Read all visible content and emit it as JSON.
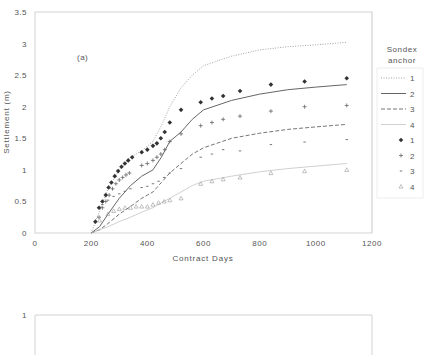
{
  "chart_data": [
    {
      "type": "line",
      "panel_label": "(a)",
      "title": "",
      "xlabel": "Contract Days",
      "ylabel": "Settlement (m)",
      "xlim": [
        0,
        1200
      ],
      "ylim": [
        0,
        3.5
      ],
      "xticks": [
        0,
        200,
        400,
        600,
        800,
        1000,
        1200
      ],
      "yticks": [
        0,
        0.5,
        1,
        1.5,
        2,
        2.5,
        3,
        3.5
      ],
      "grid": false,
      "legend_position": "right",
      "legend_title": "Sondex anchor",
      "series": [
        {
          "name": "1",
          "kind": "line",
          "style": "dotted",
          "x": [
            200,
            230,
            260,
            300,
            340,
            380,
            420,
            450,
            480,
            520,
            560,
            600,
            700,
            800,
            900,
            1000,
            1110
          ],
          "y": [
            0.0,
            0.35,
            0.7,
            1.0,
            1.2,
            1.3,
            1.45,
            1.7,
            2.0,
            2.3,
            2.5,
            2.65,
            2.8,
            2.9,
            2.95,
            2.98,
            3.02
          ]
        },
        {
          "name": "2",
          "kind": "line",
          "style": "solid",
          "x": [
            200,
            230,
            260,
            300,
            340,
            380,
            420,
            450,
            480,
            520,
            560,
            600,
            700,
            800,
            900,
            1000,
            1110
          ],
          "y": [
            0.0,
            0.1,
            0.3,
            0.55,
            0.75,
            0.9,
            1.0,
            1.2,
            1.45,
            1.6,
            1.8,
            1.95,
            2.1,
            2.2,
            2.27,
            2.31,
            2.35
          ]
        },
        {
          "name": "3",
          "kind": "line",
          "style": "dashed",
          "x": [
            200,
            230,
            260,
            300,
            340,
            380,
            420,
            450,
            480,
            520,
            560,
            600,
            700,
            800,
            900,
            1000,
            1110
          ],
          "y": [
            0.0,
            0.05,
            0.15,
            0.3,
            0.42,
            0.55,
            0.65,
            0.8,
            0.95,
            1.1,
            1.25,
            1.35,
            1.5,
            1.58,
            1.64,
            1.68,
            1.72
          ]
        },
        {
          "name": "4",
          "kind": "line",
          "style": "thin",
          "x": [
            200,
            230,
            260,
            300,
            340,
            380,
            420,
            450,
            480,
            520,
            560,
            600,
            700,
            800,
            900,
            1000,
            1110
          ],
          "y": [
            0.0,
            0.05,
            0.1,
            0.18,
            0.25,
            0.33,
            0.4,
            0.48,
            0.55,
            0.65,
            0.75,
            0.82,
            0.9,
            0.97,
            1.02,
            1.06,
            1.1
          ]
        },
        {
          "name": "1",
          "kind": "marker",
          "marker": "filled-diamond",
          "x": [
            215,
            228,
            240,
            252,
            262,
            272,
            284,
            296,
            308,
            320,
            332,
            346,
            380,
            400,
            420,
            434,
            448,
            462,
            480,
            520,
            590,
            630,
            670,
            730,
            840,
            960,
            1110
          ],
          "y": [
            0.18,
            0.4,
            0.5,
            0.6,
            0.72,
            0.8,
            0.9,
            0.98,
            1.05,
            1.1,
            1.15,
            1.2,
            1.28,
            1.32,
            1.38,
            1.42,
            1.5,
            1.6,
            1.75,
            1.95,
            2.07,
            2.13,
            2.17,
            2.25,
            2.35,
            2.4,
            2.45
          ]
        },
        {
          "name": "2",
          "kind": "marker",
          "marker": "plus",
          "x": [
            228,
            240,
            252,
            264,
            276,
            288,
            300,
            312,
            324,
            336,
            380,
            400,
            420,
            434,
            448,
            462,
            480,
            520,
            590,
            630,
            670,
            730,
            840,
            960,
            1110
          ],
          "y": [
            0.25,
            0.4,
            0.5,
            0.6,
            0.7,
            0.78,
            0.84,
            0.88,
            0.92,
            0.95,
            1.07,
            1.1,
            1.15,
            1.2,
            1.25,
            1.32,
            1.45,
            1.57,
            1.7,
            1.75,
            1.8,
            1.85,
            1.93,
            2.0,
            2.02
          ]
        },
        {
          "name": "3",
          "kind": "marker",
          "marker": "dash",
          "x": [
            240,
            260,
            280,
            300,
            320,
            340,
            380,
            400,
            420,
            440,
            460,
            480,
            520,
            590,
            630,
            670,
            730,
            840,
            960,
            1110
          ],
          "y": [
            0.45,
            0.52,
            0.58,
            0.62,
            0.66,
            0.7,
            0.72,
            0.74,
            0.78,
            0.82,
            0.88,
            0.95,
            1.02,
            1.2,
            1.25,
            1.32,
            1.3,
            1.4,
            1.44,
            1.48
          ]
        },
        {
          "name": "4",
          "kind": "marker",
          "marker": "open-triangle",
          "x": [
            230,
            260,
            280,
            300,
            320,
            340,
            360,
            380,
            400,
            420,
            440,
            460,
            480,
            520,
            590,
            630,
            670,
            730,
            840,
            960,
            1110
          ],
          "y": [
            0.2,
            0.3,
            0.35,
            0.38,
            0.4,
            0.4,
            0.42,
            0.42,
            0.42,
            0.45,
            0.48,
            0.5,
            0.52,
            0.55,
            0.78,
            0.82,
            0.85,
            0.88,
            0.95,
            0.98,
            1.0
          ]
        }
      ]
    },
    {
      "type": "line",
      "panel_label": "",
      "title": "",
      "xlabel": "",
      "ylabel": "",
      "yticks_visible": [
        1
      ],
      "note": "second panel partially visible, cut off at bottom"
    }
  ],
  "labels": {
    "panel_a": "(a)",
    "xlabel": "Contract Days",
    "ylabel": "Settlement (m)",
    "legend_title_line1": "Sondex",
    "legend_title_line2": "anchor",
    "lower_panel_ytick": "1"
  },
  "legend": {
    "items": [
      {
        "label": "1",
        "kind": "line",
        "style": "dotted"
      },
      {
        "label": "2",
        "kind": "line",
        "style": "solid"
      },
      {
        "label": "3",
        "kind": "line",
        "style": "dashed"
      },
      {
        "label": "4",
        "kind": "line",
        "style": "thin"
      },
      {
        "label": "1",
        "kind": "marker",
        "marker": "filled-diamond"
      },
      {
        "label": "2",
        "kind": "marker",
        "marker": "plus"
      },
      {
        "label": "3",
        "kind": "marker",
        "marker": "dash"
      },
      {
        "label": "4",
        "kind": "marker",
        "marker": "open-triangle"
      }
    ]
  },
  "colors": {
    "axis": "#c0c0c0",
    "text": "#555555",
    "series_dark": "#333333",
    "series_mid": "#666666",
    "series_light": "#999999",
    "series_faint": "#bbbbbb"
  }
}
